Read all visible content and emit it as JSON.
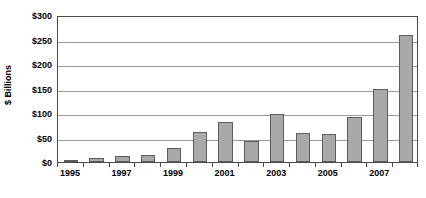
{
  "chart_data": {
    "type": "bar",
    "title": "",
    "subtitle": "",
    "xlabel": "",
    "ylabel": "$ Billions",
    "categories": [
      "1995",
      "1996",
      "1997",
      "1998",
      "1999",
      "2000",
      "2001",
      "2002",
      "2003",
      "2004",
      "2005",
      "2006",
      "2007",
      "2008"
    ],
    "values": [
      2,
      8,
      12,
      15,
      28,
      62,
      81,
      43,
      97,
      60,
      57,
      92,
      148,
      260
    ],
    "ylim": [
      0,
      300
    ],
    "ytick_values": [
      0,
      50,
      100,
      150,
      200,
      250,
      300
    ],
    "ytick_labels": [
      "$0",
      "$50",
      "$100",
      "$150",
      "$200",
      "$250",
      "$300"
    ],
    "xtick_labels": [
      "1995",
      "1997",
      "1999",
      "2001",
      "2003",
      "2005",
      "2007"
    ],
    "xtick_label_indices": [
      0,
      2,
      4,
      6,
      8,
      10,
      12
    ],
    "grid": true,
    "grid_axis": "y",
    "legend": false,
    "legend_position": "none",
    "series": [
      {
        "name": "",
        "values": [
          2,
          8,
          12,
          15,
          28,
          62,
          81,
          43,
          97,
          60,
          57,
          92,
          148,
          260
        ]
      }
    ],
    "colors": {
      "bar_fill": "#a9a9a9",
      "bar_border": "#5c5c5c",
      "gridline": "#9a9a9a",
      "frame": "#4a4a4a",
      "background": "#ffffff",
      "text": "#000000"
    }
  }
}
